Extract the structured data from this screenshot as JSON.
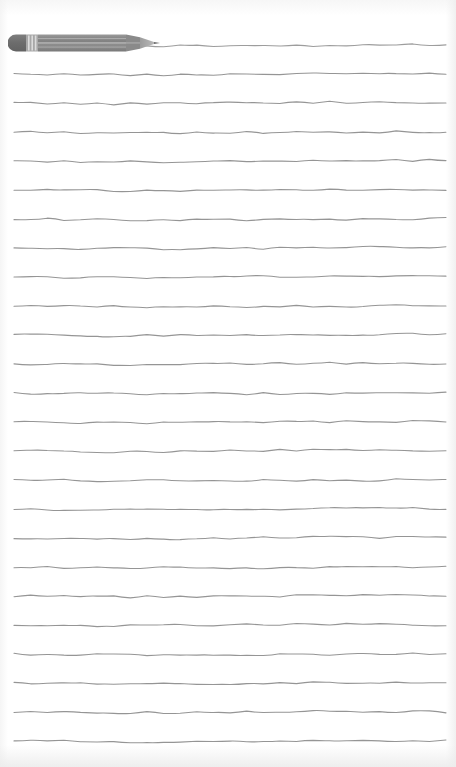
{
  "page": {
    "width": 456,
    "height": 767,
    "background_color": "#ffffff",
    "paper_edge_color": "#eeeeee"
  },
  "ruled_lines": {
    "icon_name": "ruled-line",
    "count": 25,
    "color": "#8c8c8c",
    "stroke_width": 1.1,
    "spacing_px": 29,
    "first_line_y": 45,
    "margin_left_px": 14,
    "margin_right_px": 10,
    "line_start_x": 14,
    "line_end_x": 446,
    "style": "hand-drawn-wavy",
    "y_positions": [
      45,
      74,
      103,
      132,
      161,
      190,
      219,
      248,
      277,
      306,
      335,
      364,
      393,
      422,
      451,
      480,
      509,
      538,
      567,
      596,
      625,
      654,
      683,
      712,
      741
    ],
    "wave_amplitude": 1.4
  },
  "pencil": {
    "icon_name": "pencil-icon",
    "label": "Pencil",
    "x": 8,
    "y": 31,
    "width": 152,
    "height": 24,
    "body_color": "#8e8e8e",
    "body_color_dark": "#7a7a7a",
    "body_highlight_color": "#c9c9c9",
    "eraser_color": "#6f6f6f",
    "ferrule_color": "#b9b9b9",
    "tip_color": "#9a9a9a",
    "lead_color": "#6a6a6a",
    "orientation": "horizontal-pointing-right",
    "tip_x": 157,
    "tip_y": 45
  }
}
